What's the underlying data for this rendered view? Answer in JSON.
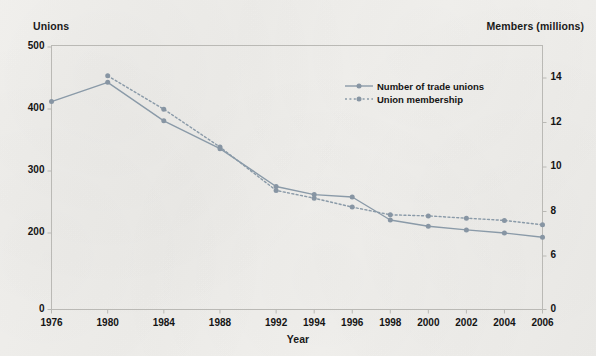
{
  "chart_data": {
    "type": "line",
    "title": "",
    "xlabel": "Year",
    "ylabel": "Unions",
    "y2label": "Members (millions)",
    "grid": false,
    "legend_position": "top-right",
    "categories": [
      "1976",
      "1980",
      "1984",
      "1988",
      "1992",
      "1994",
      "1996",
      "1998",
      "2000",
      "2002",
      "2004",
      "2006"
    ],
    "x_tick_labels": [
      "1976",
      "1980",
      "1984",
      "1988",
      "1992",
      "1994",
      "1996",
      "1998",
      "2000",
      "2002",
      "2004",
      "2006"
    ],
    "y_tick_labels": [
      "0",
      "200",
      "300",
      "400",
      "500"
    ],
    "y2_tick_labels": [
      "0",
      "6",
      "8",
      "10",
      "12",
      "14"
    ],
    "ylim": [
      180,
      500
    ],
    "y2lim": [
      5.6,
      14.6
    ],
    "axis_break_left": true,
    "axis_break_right": true,
    "series": [
      {
        "name": "Number of trade unions",
        "axis": "left",
        "style": "solid",
        "color": "#8a9aa8",
        "values": [
          412,
          443,
          381,
          336,
          275,
          262,
          258,
          221,
          211,
          205,
          200,
          193
        ]
      },
      {
        "name": "Union membership",
        "axis": "right",
        "style": "dotted",
        "color": "#8a9aa8",
        "values": [
          null,
          14.1,
          12.6,
          10.9,
          8.95,
          8.6,
          8.2,
          7.85,
          7.8,
          7.7,
          7.6,
          7.4
        ]
      }
    ]
  },
  "axes": {
    "left_title": "Unions",
    "right_title": "Members (millions)",
    "x_title": "Year"
  },
  "legend": {
    "items": [
      {
        "label": "Number of trade unions",
        "style": "solid"
      },
      {
        "label": "Union membership",
        "style": "dotted"
      }
    ]
  },
  "colors": {
    "line": "#8a9aa8",
    "marker": "#8795a3",
    "frame": "#b9b8b4",
    "text": "#141414",
    "background": "#f1f0ed"
  }
}
